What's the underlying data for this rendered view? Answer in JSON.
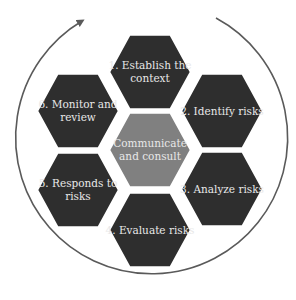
{
  "diagram": {
    "type": "hexagon-cycle",
    "center": {
      "label_lines": [
        "Communicate",
        "and consult"
      ],
      "color": "#808080"
    },
    "steps": [
      {
        "id": 1,
        "label_lines": [
          "1. Establish the",
          "context"
        ]
      },
      {
        "id": 2,
        "label_lines": [
          "2. Identify risks"
        ]
      },
      {
        "id": 3,
        "label_lines": [
          "3. Analyze risks"
        ]
      },
      {
        "id": 4,
        "label_lines": [
          "4. Evaluate risks"
        ]
      },
      {
        "id": 5,
        "label_lines": [
          "5. Responds to",
          "risks"
        ]
      },
      {
        "id": 6,
        "label_lines": [
          "6. Monitor and",
          "review"
        ]
      }
    ],
    "step_color": "#2e2e2e",
    "cycle_arrow": {
      "direction": "clockwise",
      "color": "#5a5a5a"
    }
  }
}
